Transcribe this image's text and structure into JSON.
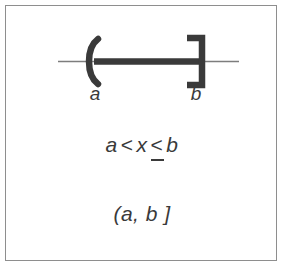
{
  "figure": {
    "kind": "number-line-interval-diagram",
    "border_color": "#8e8e8e",
    "background_color": "#ffffff",
    "ink_color": "#3a3a3a",
    "axis_color": "#808080"
  },
  "number_line": {
    "axis_label": "real number line",
    "left_endpoint": {
      "label": "a",
      "bracket": "(",
      "bracket_name": "open-paren-left",
      "included": false,
      "x": 93
    },
    "right_endpoint": {
      "label": "b",
      "bracket": "]",
      "bracket_name": "close-bracket-right",
      "included": true,
      "x": 198
    },
    "segment": {
      "name": "shaded-interval-segment",
      "from_x": 93,
      "to_x": 198,
      "axis_y": 60,
      "thickness": 6
    },
    "axis": {
      "from_x": 57,
      "to_x": 238,
      "y": 60,
      "thickness": 1
    }
  },
  "inequality": {
    "left_var": "a",
    "first_operator": "<",
    "variable": "x",
    "second_operator": "<",
    "second_operator_name": "less-than-or-equal",
    "right_var": "b",
    "full_text": "a < x ≤ b"
  },
  "interval_notation": {
    "text": "(a, b ]",
    "open_bracket": "(",
    "lower": "a",
    "separator": ",",
    "upper": "b",
    "close_bracket": "]"
  }
}
